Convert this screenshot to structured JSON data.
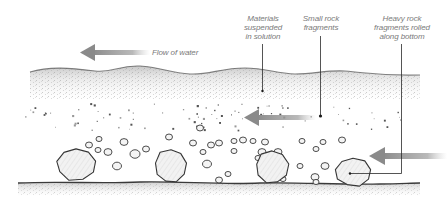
{
  "diagram": {
    "colors": {
      "background": "#ffffff",
      "ink": "#3a3a3a",
      "label_text": "#7a7a7a",
      "arrow": "#8c8c8c",
      "leader_line": "#2a2a2a",
      "water_texture": "#9a9a9a"
    },
    "labels": {
      "flow": "Flow of water",
      "suspended": "Materials\nsuspended\nin solution",
      "small_fragments": "Small rock\nfragments",
      "heavy_fragments": "Heavy rock\nfragments rolled\nalong bottom"
    },
    "layers": [
      {
        "name": "water-surface-layer",
        "description": "Materials suspended in solution",
        "y_top": 67,
        "y_bottom": 100
      },
      {
        "name": "small-fragment-layer",
        "description": "Small rock fragments",
        "y_top": 105,
        "y_bottom": 130
      },
      {
        "name": "pebble-layer",
        "description": "Pebbles",
        "y_top": 135,
        "y_bottom": 180
      },
      {
        "name": "river-bed",
        "description": "Heavy rock fragments rolled along bottom",
        "y": 183
      }
    ],
    "arrows": [
      {
        "name": "flow-arrow-top",
        "x1": 145,
        "x2": 80,
        "y": 52
      },
      {
        "name": "flow-arrow-middle",
        "x1": 305,
        "x2": 244,
        "y": 117
      },
      {
        "name": "flow-arrow-bottom",
        "x1": 447,
        "x2": 370,
        "y": 156
      }
    ],
    "leaders": [
      {
        "name": "leader-suspended",
        "x": 262,
        "y1": 44,
        "y2": 91
      },
      {
        "name": "leader-small-fragments",
        "x": 320,
        "y1": 36,
        "y2": 117
      },
      {
        "name": "leader-heavy-fragments",
        "x": 401,
        "y1": 44,
        "y2": 173,
        "x_end": 350
      }
    ],
    "boulders": [
      {
        "cx": 76,
        "cy": 164,
        "rx": 21,
        "ry": 17
      },
      {
        "cx": 171,
        "cy": 166,
        "rx": 17,
        "ry": 18
      },
      {
        "cx": 272,
        "cy": 167,
        "rx": 17,
        "ry": 17
      },
      {
        "cx": 353,
        "cy": 172,
        "rx": 19,
        "ry": 15
      }
    ],
    "pebbles": [
      [
        89,
        145,
        3.5
      ],
      [
        99,
        139,
        3
      ],
      [
        98,
        150,
        3
      ],
      [
        108,
        152,
        4
      ],
      [
        117,
        166,
        4.5
      ],
      [
        124,
        142,
        4
      ],
      [
        135,
        154,
        5
      ],
      [
        146,
        149,
        3.5
      ],
      [
        169,
        137,
        3.5
      ],
      [
        193,
        143,
        3.5
      ],
      [
        203,
        152,
        3
      ],
      [
        207,
        164,
        4.5
      ],
      [
        219,
        143,
        3.5
      ],
      [
        219,
        180,
        3.5
      ],
      [
        228,
        174,
        3
      ],
      [
        234,
        141,
        3
      ],
      [
        234,
        151,
        3
      ],
      [
        243,
        140,
        3.5
      ],
      [
        253,
        141,
        3
      ],
      [
        262,
        152,
        4
      ],
      [
        258,
        158,
        3
      ],
      [
        265,
        142,
        3.5
      ],
      [
        200,
        128,
        3.5
      ],
      [
        211,
        145,
        3.5
      ],
      [
        278,
        152,
        4
      ],
      [
        302,
        141,
        3
      ],
      [
        316,
        149,
        3
      ],
      [
        323,
        142,
        3
      ],
      [
        325,
        166,
        4
      ],
      [
        342,
        140,
        3.5
      ],
      [
        283,
        179,
        3
      ],
      [
        300,
        166,
        3
      ],
      [
        315,
        177,
        4
      ],
      [
        316,
        182,
        3
      ]
    ],
    "grit_dots": 90
  }
}
